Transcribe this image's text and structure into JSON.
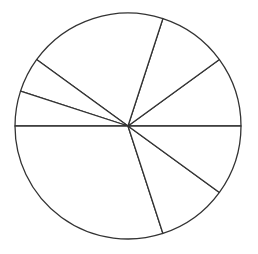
{
  "chart_data": {
    "type": "pie",
    "title": "",
    "labels": [
      "",
      "",
      "",
      "",
      "",
      "",
      "",
      ""
    ],
    "values": [
      10,
      10,
      20,
      5,
      5,
      30,
      10,
      10
    ],
    "start_angle_deg": 0,
    "direction": "counterclockwise",
    "legend": null,
    "fill_color": "#ffffff",
    "stroke_color": "#333333",
    "center": [
      128,
      126
    ],
    "radius": 113
  }
}
